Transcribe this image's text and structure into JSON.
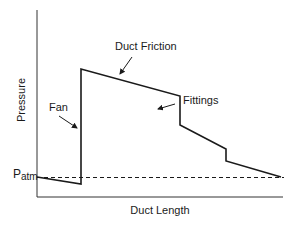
{
  "diagram": {
    "type": "pressure-profile",
    "axes": {
      "xlabel": "Duct Length",
      "ylabel": "Pressure"
    },
    "reference_line": {
      "label_main": "P",
      "label_sub": "atm",
      "style": "dashed"
    },
    "annotations": {
      "duct_friction": "Duct Friction",
      "fittings": "Fittings",
      "fan": "Fan"
    },
    "colors": {
      "line": "#1a1a1a",
      "axis": "#333333",
      "background": "#ffffff"
    }
  }
}
